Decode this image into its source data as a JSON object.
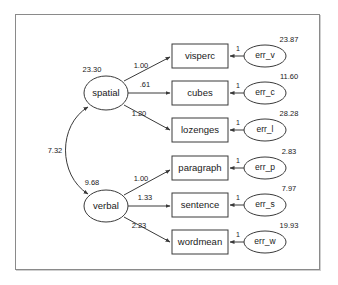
{
  "diagram": {
    "type": "sem-path-diagram",
    "title": "",
    "latent_factors": [
      {
        "id": "spatial",
        "label": "spatial",
        "variance": "23.30",
        "cx": 106,
        "cy": 93,
        "rx": 22,
        "ry": 17
      },
      {
        "id": "verbal",
        "label": "verbal",
        "variance": "9.68",
        "cx": 106,
        "cy": 206,
        "rx": 22,
        "ry": 16
      }
    ],
    "factor_covariance": {
      "from": "spatial",
      "to": "verbal",
      "value": "7.32"
    },
    "observed_variables": [
      {
        "id": "visperc",
        "label": "visperc",
        "factor": "spatial",
        "loading": "1.00",
        "x": 172,
        "y": 44,
        "w": 56,
        "h": 24
      },
      {
        "id": "cubes",
        "label": "cubes",
        "factor": "spatial",
        "loading": ".61",
        "x": 172,
        "y": 81,
        "w": 56,
        "h": 24
      },
      {
        "id": "lozenges",
        "label": "lozenges",
        "factor": "spatial",
        "loading": "1.20",
        "x": 172,
        "y": 118,
        "w": 56,
        "h": 24
      },
      {
        "id": "paragraph",
        "label": "paragraph",
        "factor": "verbal",
        "loading": "1.00",
        "x": 172,
        "y": 156,
        "w": 56,
        "h": 24
      },
      {
        "id": "sentence",
        "label": "sentence",
        "factor": "verbal",
        "loading": "1.33",
        "x": 172,
        "y": 193,
        "w": 56,
        "h": 24
      },
      {
        "id": "wordmean",
        "label": "wordmean",
        "factor": "verbal",
        "loading": "2.23",
        "x": 172,
        "y": 230,
        "w": 56,
        "h": 24
      }
    ],
    "error_terms": [
      {
        "id": "err_v",
        "label": "err_v",
        "target": "visperc",
        "variance": "23.87",
        "path_label": "1",
        "cx": 265,
        "cy": 56
      },
      {
        "id": "err_c",
        "label": "err_c",
        "target": "cubes",
        "variance": "11.60",
        "path_label": "1",
        "cx": 265,
        "cy": 93
      },
      {
        "id": "err_l",
        "label": "err_l",
        "target": "lozenges",
        "variance": "28.28",
        "path_label": "1",
        "cx": 265,
        "cy": 130
      },
      {
        "id": "err_p",
        "label": "err_p",
        "target": "paragraph",
        "variance": "2.83",
        "path_label": "1",
        "cx": 265,
        "cy": 168
      },
      {
        "id": "err_s",
        "label": "err_s",
        "target": "sentence",
        "variance": "7.97",
        "path_label": "1",
        "cx": 265,
        "cy": 205
      },
      {
        "id": "err_w",
        "label": "err_w",
        "target": "wordmean",
        "variance": "19.93",
        "path_label": "1",
        "cx": 265,
        "cy": 242
      }
    ],
    "colors": {
      "stroke": "#3a3a3a",
      "frame": "#8a8a8a",
      "background": "#ffffff",
      "text": "#1a1a1a"
    }
  }
}
